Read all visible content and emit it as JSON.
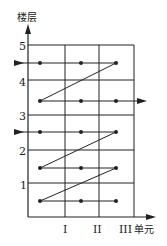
{
  "diagram": {
    "y_axis_label": "楼层",
    "x_axis_label": "单元",
    "y_ticks": [
      "5",
      "4",
      "3",
      "2",
      "1"
    ],
    "x_ticks": [
      "I",
      "II",
      "III"
    ],
    "colors": {
      "line": "#222222",
      "background": "#ffffff"
    }
  }
}
